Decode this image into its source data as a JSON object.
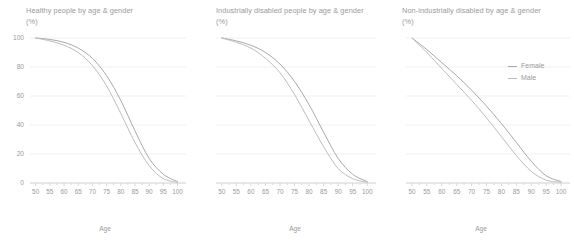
{
  "panels": [
    {
      "title": "Healthy people by age & gender\n(%)",
      "xlabel": "Age"
    },
    {
      "title": "Industrially disabled people by age & gender\n(%)",
      "xlabel": "Age"
    },
    {
      "title": "Non-industrially disabled by age & gender\n(%)",
      "xlabel": "Age"
    }
  ],
  "legend": {
    "position": "top-right",
    "items": [
      {
        "label": "Female",
        "color": "#a8a8a8"
      },
      {
        "label": "Male",
        "color": "#bdbdbd"
      }
    ]
  },
  "axis": {
    "y_ticks": [
      "0",
      "20",
      "40",
      "60",
      "80",
      "100"
    ],
    "x_ticks": [
      "50",
      "55",
      "60",
      "65",
      "70",
      "75",
      "80",
      "85",
      "90",
      "95",
      "100"
    ],
    "xlim": [
      48,
      103
    ],
    "ylim": [
      0,
      100
    ],
    "grid": "horizontal-faint"
  },
  "colors": {
    "text": "#9a9a9a",
    "axis": "#d8d8d8",
    "grid": "#f0f0f0",
    "female": "#a8a8a8",
    "male": "#bdbdbd",
    "background": "#ffffff"
  },
  "chart_data": [
    {
      "type": "line",
      "title": "Healthy people by age & gender (%)",
      "xlabel": "Age",
      "ylabel": "(%)",
      "xlim": [
        48,
        103
      ],
      "ylim": [
        0,
        100
      ],
      "grid": true,
      "legend_position": "outside-right",
      "x": [
        50,
        55,
        60,
        65,
        70,
        75,
        80,
        85,
        90,
        95,
        100
      ],
      "series": [
        {
          "name": "Female",
          "values": [
            100,
            99,
            97,
            93,
            86,
            74,
            57,
            36,
            17,
            6,
            1
          ]
        },
        {
          "name": "Male",
          "values": [
            100,
            98,
            95,
            90,
            81,
            67,
            48,
            28,
            12,
            3,
            0.5
          ]
        }
      ]
    },
    {
      "type": "line",
      "title": "Industrially disabled people by age & gender (%)",
      "xlabel": "Age",
      "ylabel": "(%)",
      "xlim": [
        48,
        103
      ],
      "ylim": [
        0,
        100
      ],
      "grid": true,
      "legend_position": "outside-right",
      "x": [
        50,
        55,
        60,
        65,
        70,
        75,
        80,
        85,
        90,
        95,
        100
      ],
      "series": [
        {
          "name": "Female",
          "values": [
            100,
            98,
            95,
            90,
            82,
            70,
            54,
            35,
            17,
            6,
            1
          ]
        },
        {
          "name": "Male",
          "values": [
            100,
            97,
            93,
            86,
            76,
            61,
            43,
            25,
            10,
            3,
            0.5
          ]
        }
      ]
    },
    {
      "type": "line",
      "title": "Non-industrially disabled by age & gender (%)",
      "xlabel": "Age",
      "ylabel": "(%)",
      "xlim": [
        48,
        103
      ],
      "ylim": [
        0,
        100
      ],
      "grid": true,
      "legend_position": "outside-right",
      "x": [
        50,
        55,
        60,
        65,
        70,
        75,
        80,
        85,
        90,
        95,
        100
      ],
      "series": [
        {
          "name": "Female",
          "values": [
            100,
            92,
            83,
            74,
            64,
            53,
            41,
            28,
            15,
            5,
            1
          ]
        },
        {
          "name": "Male",
          "values": [
            100,
            90,
            79,
            68,
            57,
            45,
            32,
            19,
            8,
            2,
            0.5
          ]
        }
      ]
    }
  ]
}
